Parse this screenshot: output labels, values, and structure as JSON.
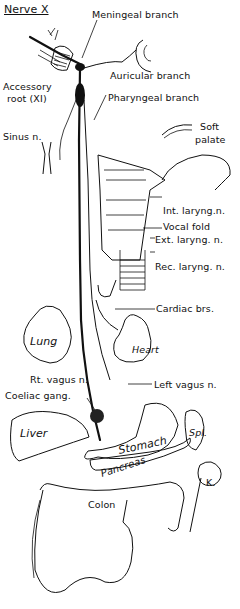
{
  "title": "Nerve X",
  "labels": {
    "meningeal": "Meningeal branch",
    "accessory_line1": "Accessory",
    "accessory_line2": "root (XI)",
    "auricular": "Auricular branch",
    "pharyngeal": "Pharyngeal branch",
    "sinus": "Sinus n.",
    "soft_palate_line1": "Soft",
    "soft_palate_line2": "palate",
    "int_laryng": "Int. laryng.n.",
    "vocal_fold": "Vocal fold",
    "ext_laryng": "Ext. laryng. n.",
    "rec_laryng": "Rec. laryng. n.",
    "cardiac": "Cardiac brs.",
    "rt_vagus": "Rt. vagus n.",
    "left_vagus": "Left vagus n.",
    "coeliac": "Coeliac gang.",
    "lung": "Lung",
    "heart": "Heart",
    "liver": "Liver",
    "stomach": "Stomach",
    "spleen": "Spl.",
    "pancreas": "Pancreas",
    "kidney": "K.",
    "colon": "Colon"
  }
}
